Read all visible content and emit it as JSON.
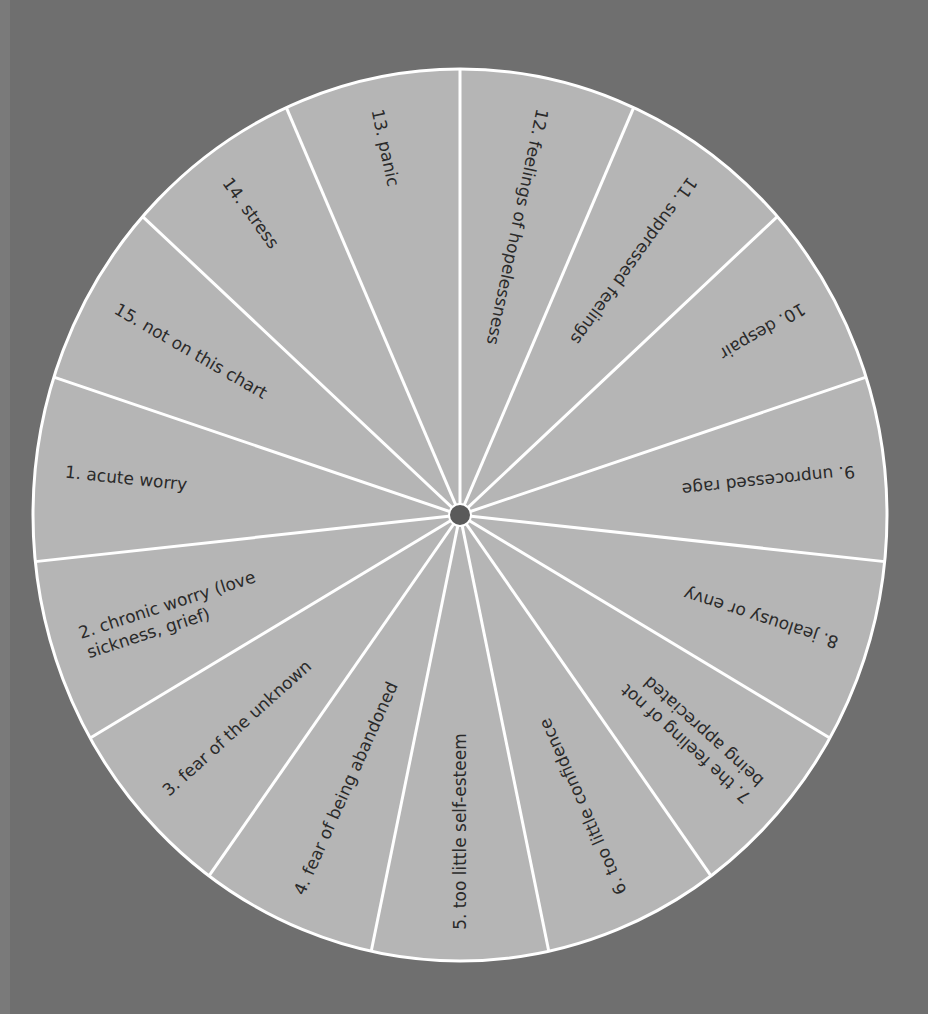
{
  "chart_data": {
    "type": "wheel",
    "title": "",
    "segment_count": 15,
    "segments": [
      {
        "number": "1.",
        "label": [
          "acute worry"
        ]
      },
      {
        "number": "2.",
        "label": [
          "chronic worry (love",
          "sickness, grief)"
        ]
      },
      {
        "number": "3.",
        "label": [
          "fear of the unknown"
        ]
      },
      {
        "number": "4.",
        "label": [
          "fear of being abandoned"
        ]
      },
      {
        "number": "5.",
        "label": [
          "too little self-esteem"
        ]
      },
      {
        "number": "6.",
        "label": [
          "too little confidence"
        ]
      },
      {
        "number": "7.",
        "label": [
          "the feeling of not",
          "being appreciated"
        ]
      },
      {
        "number": "8.",
        "label": [
          "jealousy or envy"
        ]
      },
      {
        "number": "9.",
        "label": [
          "unprocessed rage"
        ]
      },
      {
        "number": "10.",
        "label": [
          "despair"
        ]
      },
      {
        "number": "11.",
        "label": [
          "suppressed feelings"
        ]
      },
      {
        "number": "12.",
        "label": [
          "feelings of hopelessness"
        ]
      },
      {
        "number": "13.",
        "label": [
          "panic"
        ]
      },
      {
        "number": "14.",
        "label": [
          "stress"
        ]
      },
      {
        "number": "15.",
        "label": [
          "not on this chart"
        ]
      }
    ]
  },
  "colors": {
    "background": "#6f6f6f",
    "wheel_fill": "#b5b5b5",
    "spoke": "#ffffff",
    "hub": "#5a5a5a",
    "text": "#2a2a2a"
  }
}
